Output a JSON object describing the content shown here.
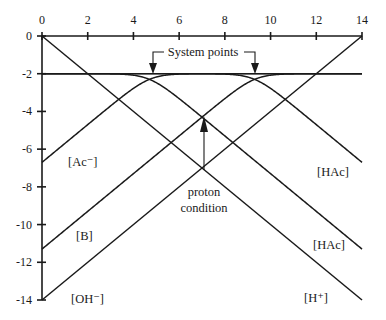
{
  "chart_data": {
    "type": "line",
    "title": "",
    "xlabel": "pH",
    "ylabel": "log C",
    "xlim": [
      0,
      14
    ],
    "ylim": [
      -14,
      0
    ],
    "x_ticks": [
      0,
      2,
      4,
      6,
      8,
      10,
      12,
      14
    ],
    "y_ticks": [
      0,
      -2,
      -4,
      -6,
      -8,
      -10,
      -12,
      -14
    ],
    "x_tick_labels": [
      "0",
      "2",
      "4",
      "6",
      "8",
      "10",
      "12",
      "14"
    ],
    "y_tick_labels": [
      "0",
      "-2",
      "-4",
      "-6",
      "-8",
      "-10",
      "-12",
      "-14"
    ],
    "grid": false,
    "x_axis_position": "top",
    "total_concentration_log": -2,
    "systems": [
      {
        "name": "acetic acid",
        "pKa": 4.7,
        "log_C": -2
      },
      {
        "name": "base B",
        "pKa": 9.3,
        "log_C": -2
      }
    ],
    "series": [
      {
        "name": "[H+]",
        "kind": "line",
        "points": [
          [
            0,
            0
          ],
          [
            14,
            -14
          ]
        ]
      },
      {
        "name": "[OH-]",
        "kind": "line",
        "points": [
          [
            0,
            -14
          ],
          [
            14,
            0
          ]
        ]
      },
      {
        "name": "[Ac-]",
        "kind": "base",
        "pKa": 4.7,
        "log_C": -2,
        "value_at_pH0": -6.7,
        "value_at_pH14": -2
      },
      {
        "name": "[HAc]",
        "kind": "acid",
        "pKa": 4.7,
        "log_C": -2,
        "value_at_pH0": -2,
        "value_at_pH14": -11.3
      },
      {
        "name": "[B]",
        "kind": "base",
        "pKa": 9.3,
        "log_C": -2,
        "value_at_pH0": -11.3,
        "value_at_pH14": -2
      },
      {
        "name": "[HAc] (acid of B system)",
        "kind": "acid",
        "pKa": 9.3,
        "log_C": -2,
        "value_at_pH0": -2,
        "value_at_pH14": -6.7
      }
    ],
    "system_points": [
      [
        4.7,
        -2
      ],
      [
        9.3,
        -2
      ]
    ],
    "proton_condition": {
      "pH": 7.0,
      "log_C": -4.15
    }
  },
  "labels": {
    "ac_minus": "[Ac⁻]",
    "b": "[B]",
    "oh_minus": "[OH⁻]",
    "hac_upper": "[HAc]",
    "hac_lower": "[HAc]",
    "h_plus": "[H⁺]",
    "system_points": "System points",
    "proton_line1": "proton",
    "proton_line2": "condition"
  }
}
